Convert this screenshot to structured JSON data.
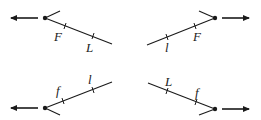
{
  "diagram": {
    "colors": {
      "ink": "#1a1a1a",
      "background": "#ffffff"
    },
    "panels": [
      {
        "id": "top-left",
        "arrow_direction": "left",
        "labels": {
          "first": "F",
          "second": "L"
        }
      },
      {
        "id": "top-right",
        "arrow_direction": "right",
        "labels": {
          "first": "l",
          "second": "F"
        }
      },
      {
        "id": "bottom-left",
        "arrow_direction": "left",
        "labels": {
          "first": "f",
          "second": "l"
        }
      },
      {
        "id": "bottom-right",
        "arrow_direction": "right",
        "labels": {
          "first": "L",
          "second": "f"
        }
      }
    ]
  }
}
